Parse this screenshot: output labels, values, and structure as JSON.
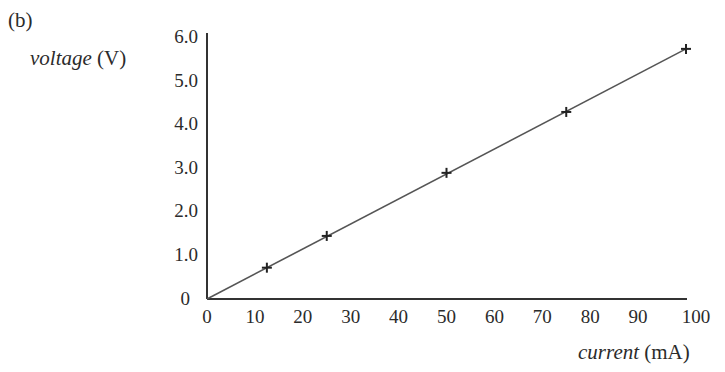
{
  "part_label": "(b)",
  "axes": {
    "y_label_var": "voltage",
    "y_label_unit": "(V)",
    "x_label_var": "current",
    "x_label_unit": "(mA)"
  },
  "colors": {
    "text": "#2b2b2b",
    "axis": "#333333",
    "line": "#555555",
    "marker": "#222222"
  },
  "chart_data": {
    "type": "line",
    "title": "",
    "panel_label": "(b)",
    "xlabel": "current (mA)",
    "ylabel": "voltage (V)",
    "xlim": [
      0,
      100
    ],
    "ylim": [
      0,
      6.0
    ],
    "x_ticks": [
      "0",
      "10",
      "20",
      "30",
      "40",
      "50",
      "60",
      "70",
      "80",
      "90",
      "100"
    ],
    "y_ticks": [
      "0",
      "1.0",
      "2.0",
      "3.0",
      "4.0",
      "5.0",
      "6.0"
    ],
    "grid": false,
    "legend": null,
    "series": [
      {
        "name": "measured points",
        "marker": "+",
        "x": [
          12.5,
          25,
          50,
          75,
          100
        ],
        "y": [
          0.72,
          1.45,
          2.9,
          4.3,
          5.75
        ]
      },
      {
        "name": "best-fit line",
        "style": "solid",
        "x": [
          0,
          100
        ],
        "y": [
          0,
          5.75
        ]
      }
    ]
  }
}
